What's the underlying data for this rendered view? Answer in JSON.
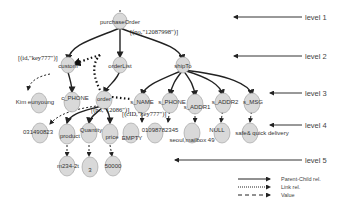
{
  "diagram": {
    "nodes": {
      "purchaseOrder": "purchaseOrder",
      "customer": "custom",
      "orderList": "orderList",
      "shipTo": "shipTo",
      "kim": "Kim eunyoung",
      "c_phone": "c_PHONE",
      "order": "order",
      "s_name": "s_NAME",
      "s_phone": "s_PHONE",
      "s_addr1": "s_ADDR1",
      "s_addr2": "s_ADDR2",
      "s_msg": "s_MSG",
      "v031": "031490823",
      "product": "product",
      "quantity": "Quantity",
      "price": "price",
      "empty": "EMPTY",
      "v010": "01098782345",
      "seoul": "seoul,mailbox 49",
      "null": "NULL",
      "safe": "safe& quick delivery",
      "m234": "m234-2t",
      "three": "3",
      "fifty": "50000"
    },
    "attributes": {
      "purchaseOrder": "[(no,\"12087998\")]",
      "customer": "[(id,\"key777\")]",
      "order": "[(no,\"12086\")]",
      "s_name": "[(cID,\"key777\")]"
    },
    "levels": [
      "level 1",
      "level 2",
      "level 3",
      "level 4",
      "level 5"
    ],
    "legend": {
      "parent_child": "Parent-Child rel.",
      "link": "Link rel.",
      "value": "Value"
    }
  }
}
